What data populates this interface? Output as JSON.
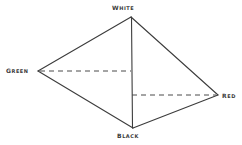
{
  "diagram": {
    "type": "tetrahedron-color-solid",
    "background_color": "#ffffff",
    "stroke_color": "#3c3c3c",
    "solid_stroke_width": 1.1,
    "dashed_stroke_width": 1.0,
    "dash_pattern": "5 4",
    "vertices": [
      {
        "id": "white",
        "label": "WHITE",
        "x": 131,
        "y": 17,
        "label_position": "above"
      },
      {
        "id": "green",
        "label": "GREEN",
        "x": 38,
        "y": 71,
        "label_position": "left"
      },
      {
        "id": "red",
        "label": "RED",
        "x": 218,
        "y": 95,
        "label_position": "right"
      },
      {
        "id": "black",
        "label": "BLACK",
        "x": 133,
        "y": 128,
        "label_position": "below"
      }
    ],
    "edges": [
      {
        "from": "white",
        "to": "green",
        "style": "solid",
        "name": "edge-white-green"
      },
      {
        "from": "white",
        "to": "red",
        "style": "solid",
        "name": "edge-white-red"
      },
      {
        "from": "green",
        "to": "black",
        "style": "solid",
        "name": "edge-green-black"
      },
      {
        "from": "red",
        "to": "black",
        "style": "solid",
        "name": "edge-red-black"
      },
      {
        "from": "white",
        "to": "black",
        "style": "solid",
        "name": "edge-white-black"
      },
      {
        "from": "green",
        "to": "red",
        "style": "dashed",
        "name": "edge-green-red"
      }
    ],
    "hidden_edge_note": "green-to-red edge drawn dashed, bending at the vertical white-black axis"
  }
}
